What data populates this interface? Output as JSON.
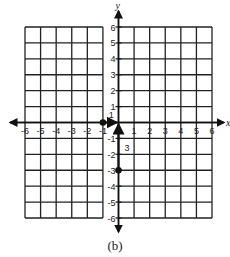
{
  "chart_data": {
    "type": "scatter",
    "title": "",
    "caption": "(b)",
    "xlabel": "x",
    "ylabel": "y",
    "xlim": [
      -6,
      6
    ],
    "ylim": [
      -6,
      6
    ],
    "grid": true,
    "x_ticks": [
      -6,
      -5,
      -4,
      -3,
      -2,
      -1,
      0,
      1,
      2,
      3,
      4,
      5,
      6
    ],
    "y_ticks": [
      -6,
      -5,
      -4,
      -3,
      -2,
      -1,
      1,
      2,
      3,
      4,
      5,
      6
    ],
    "points": [
      {
        "x": -1,
        "y": 0
      },
      {
        "x": 0,
        "y": -3
      }
    ],
    "annotations": [
      {
        "type": "arrow",
        "from": [
          -1,
          0
        ],
        "to": [
          0,
          0
        ],
        "label": "1"
      },
      {
        "type": "arrow",
        "from": [
          0,
          -3
        ],
        "to": [
          0,
          0
        ],
        "label": "3"
      }
    ]
  },
  "caption": "(b)",
  "labels": {
    "x_axis": "x",
    "y_axis": "y",
    "translation_horizontal": "1",
    "translation_vertical": "3"
  }
}
